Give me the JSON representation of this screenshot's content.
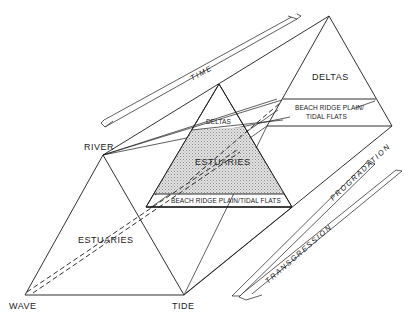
{
  "diagram": {
    "type": "ternary-prism",
    "vertices": {
      "river": "RIVER",
      "wave": "WAVE",
      "tide": "TIDE"
    },
    "front_triangle": {
      "fill_label": "ESTUARIES"
    },
    "middle_triangle": {
      "top_label": "DELTAS",
      "middle_label": "ESTUARIES",
      "bottom_label": "BEACH RIDGE PLAIN/TIDAL FLATS"
    },
    "back_triangle": {
      "top_label": "DELTAS",
      "band_label_line1": "BEACH RIDGE PLAIN/",
      "band_label_line2": "TIDAL FLATS"
    },
    "arrows": {
      "time": "TIME",
      "progradation": "PROGRADATION",
      "transgression": "TRANSGRESSION"
    },
    "colors": {
      "line": "#1a1a1a",
      "estuary_fill": "#d6d6d6",
      "background": "#ffffff"
    }
  }
}
